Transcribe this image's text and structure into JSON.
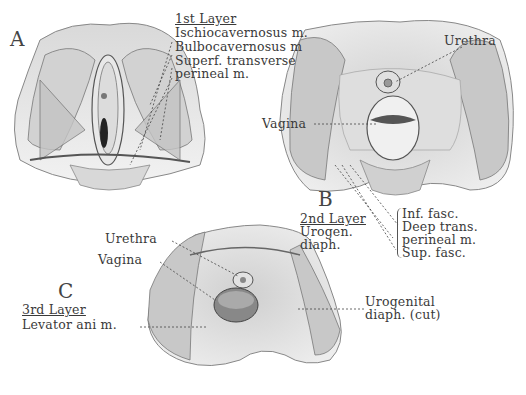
{
  "figure": {
    "panels": [
      {
        "id": "A",
        "letter": "A",
        "layer_title": "1st Layer",
        "labels": [
          "Ischiocavernosus m.",
          "Bulbocavernosus m",
          "Superf. transverse",
          "perineal m."
        ]
      },
      {
        "id": "B",
        "letter": "B",
        "layer_title": "2nd Layer",
        "layer_sub": [
          "Urogen.",
          "diaph."
        ],
        "labels": {
          "urethra": "Urethra",
          "vagina": "Vagina"
        },
        "bracket_items": [
          "Inf. fasc.",
          "Deep trans.",
          "perineal m.",
          "Sup. fasc."
        ]
      },
      {
        "id": "C",
        "letter": "C",
        "layer_title": "3rd Layer",
        "layer_sub": [
          "Levator ani m."
        ],
        "labels": {
          "urethra": "Urethra",
          "vagina": "Vagina",
          "urogenital": [
            "Urogenital",
            "diaph. (cut)"
          ]
        }
      }
    ],
    "colors": {
      "background": "#ffffff",
      "ink": "#3a3a3a",
      "tissue_light": "#e6e6e6",
      "tissue_mid": "#b8b8b8",
      "tissue_dark": "#555555"
    }
  }
}
